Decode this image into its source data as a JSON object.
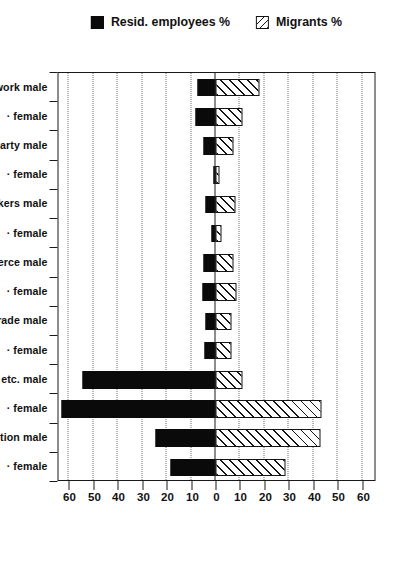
{
  "chart_data": {
    "type": "bar",
    "title": "",
    "xlabel": "",
    "ylabel": "",
    "ylim": [
      -65,
      65
    ],
    "grid": true,
    "orientation": "vertical-rotated-90",
    "legend_position": "left",
    "y_ticks": [
      {
        "value": 60,
        "label": "60"
      },
      {
        "value": 50,
        "label": "50"
      },
      {
        "value": 40,
        "label": "40"
      },
      {
        "value": 30,
        "label": "30"
      },
      {
        "value": 20,
        "label": "20"
      },
      {
        "value": 10,
        "label": "10"
      },
      {
        "value": 0,
        "label": "0"
      },
      {
        "value": -10,
        "label": "10"
      },
      {
        "value": -20,
        "label": "20"
      },
      {
        "value": -30,
        "label": "30"
      },
      {
        "value": -40,
        "label": "40"
      },
      {
        "value": -50,
        "label": "50"
      },
      {
        "value": -60,
        "label": "60"
      }
    ],
    "categories": [
      "Technical work male",
      "·          female",
      "Govern., party male",
      "·          female",
      "Office workers male",
      "·          female",
      "Commerce    male",
      "·          female",
      "Service trade  male",
      "·          female",
      "Farming, etc.  male",
      "·          female",
      "Production   male",
      "·          female"
    ],
    "series": [
      {
        "name": "Migrants %",
        "key": "migrants",
        "style": "hatched",
        "color": "#141414",
        "values": [
          18,
          11,
          7.5,
          1.5,
          8,
          2.5,
          7.5,
          8.5,
          6.5,
          6.5,
          11,
          43.5,
          43,
          28.5
        ]
      },
      {
        "name": "Resid. employees %",
        "key": "residents",
        "style": "solid-black",
        "color": "#0a0a0a",
        "values": [
          -7.5,
          -8,
          -5,
          -1,
          -4,
          -1.5,
          -5,
          -5.5,
          -4,
          -4.5,
          -54.5,
          -63,
          -24.5,
          -18.5
        ]
      }
    ]
  },
  "legend": {
    "entries": [
      {
        "label": "Resid. employees %",
        "swatch": "black"
      },
      {
        "label": "Migrants %",
        "swatch": "hatch"
      }
    ]
  }
}
